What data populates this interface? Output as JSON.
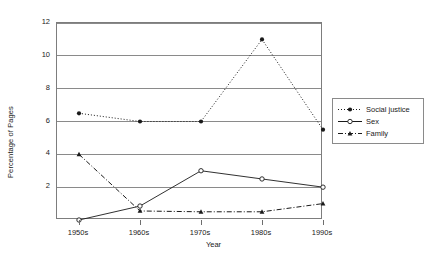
{
  "chart_data": {
    "type": "line",
    "title": "",
    "xlabel": "Year",
    "ylabel": "Percentage of Pages",
    "categories": [
      "1950s",
      "1960s",
      "1970s",
      "1980s",
      "1990s"
    ],
    "ylim": [
      0,
      12
    ],
    "yticks": [
      2,
      4,
      6,
      8,
      10,
      12
    ],
    "ytick_labels": [
      "2",
      "4",
      "6",
      "8",
      "10",
      "12"
    ],
    "grid": "horizontal",
    "legend_position": "right",
    "series": [
      {
        "name": "Social justice",
        "values": [
          6.5,
          6.0,
          6.0,
          11.0,
          5.5
        ],
        "line_style": "dotted",
        "marker": "filled-circle",
        "color": "#1a1a1a"
      },
      {
        "name": "Sex",
        "values": [
          0.0,
          0.85,
          3.0,
          2.5,
          2.0
        ],
        "line_style": "solid",
        "marker": "open-circle",
        "color": "#1a1a1a"
      },
      {
        "name": "Family",
        "values": [
          4.0,
          0.55,
          0.5,
          0.5,
          1.0
        ],
        "line_style": "dash-dot",
        "marker": "filled-triangle",
        "color": "#1a1a1a"
      }
    ]
  },
  "axes": {
    "ylabel_text": "Percentage of Pages",
    "xlabel_text": "Year"
  },
  "legend": {
    "items": [
      {
        "label": "Social justice"
      },
      {
        "label": "Sex"
      },
      {
        "label": "Family"
      }
    ]
  },
  "colors": {
    "ink": "#1a1a1a",
    "grid": "#8a8a8a",
    "frame": "#7d7d7d",
    "background": "#ffffff"
  }
}
